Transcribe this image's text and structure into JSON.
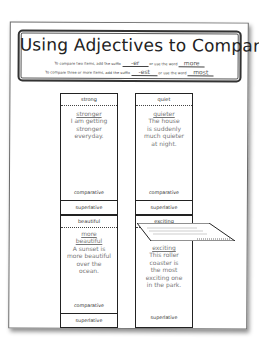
{
  "worksheet": {
    "title": "Using Adjectives to Compare",
    "instructions": [
      {
        "prefix": "To compare two items, add the suffix",
        "suffix": "-er",
        "middle": "or use the word",
        "word": "more"
      },
      {
        "prefix": "To compare three or more items, add the suffix",
        "suffix": "-est",
        "middle": "or use the word",
        "word": "most"
      }
    ]
  },
  "cards": [
    {
      "adjective": "strong",
      "answer": "stronger",
      "sentence": [
        "I am getting",
        "stronger",
        "everyday."
      ],
      "label": "comparative",
      "footer": "superlative"
    },
    {
      "adjective": "quiet",
      "answer": "quieter",
      "sentence": [
        "The house",
        "is suddenly",
        "much quieter",
        "at night."
      ],
      "label": "comparative",
      "footer": "superlative"
    },
    {
      "adjective": "beautiful",
      "answer": "more beautiful",
      "sentence": [
        "A sunset is",
        "more beautiful",
        "over the",
        "ocean."
      ],
      "label": "comparative",
      "footer": "superlative"
    },
    {
      "adjective": "exciting",
      "answer": "exciting",
      "sentence": [
        "This roller",
        "coaster is",
        "the most",
        "exciting one",
        "in the park."
      ],
      "label": "",
      "footer": "superlative"
    }
  ]
}
